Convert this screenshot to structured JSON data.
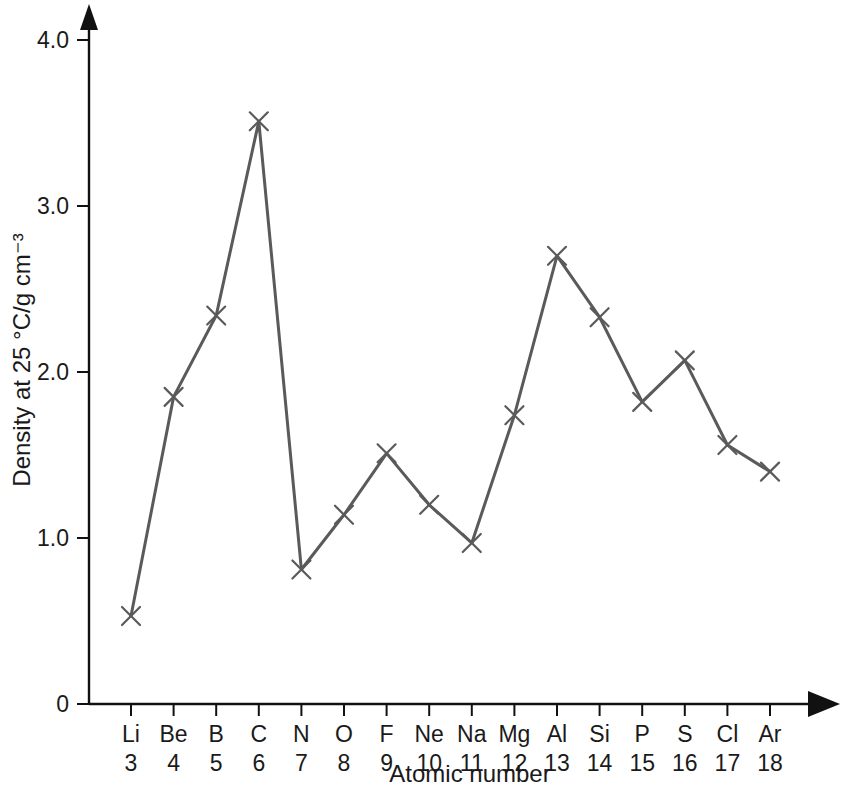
{
  "chart_data": {
    "type": "line",
    "title": "",
    "subtitle": "",
    "xlabel": "Atomic number",
    "ylabel": "Density at 25 °C/g cm⁻³",
    "grid": false,
    "legend": "none",
    "marker": "x-cross",
    "line_color": "#5a5a5a",
    "marker_color": "#5a5a5a",
    "axis_color": "#111111",
    "xlim": [
      0,
      19
    ],
    "ylim": [
      0,
      4.3
    ],
    "yticks": [
      "0",
      "1.0",
      "2.0",
      "3.0",
      "4.0"
    ],
    "ytick_values": [
      0,
      1.0,
      2.0,
      3.0,
      4.0
    ],
    "categories": [
      "Li",
      "Be",
      "B",
      "C",
      "N",
      "O",
      "F",
      "Ne",
      "Na",
      "Mg",
      "Al",
      "Si",
      "P",
      "S",
      "Cl",
      "Ar"
    ],
    "x": [
      3,
      4,
      5,
      6,
      7,
      8,
      9,
      10,
      11,
      12,
      13,
      14,
      15,
      16,
      17,
      18
    ],
    "xtick_numbers": [
      "3",
      "4",
      "5",
      "6",
      "7",
      "8",
      "9",
      "10",
      "11",
      "12",
      "13",
      "14",
      "15",
      "16",
      "17",
      "18"
    ],
    "values": [
      0.53,
      1.85,
      2.34,
      3.51,
      0.81,
      1.14,
      1.51,
      1.2,
      0.97,
      1.74,
      2.7,
      2.33,
      1.82,
      2.07,
      1.56,
      1.4
    ],
    "points": [
      {
        "element": "Li",
        "atomic_number": 3,
        "density": 0.53
      },
      {
        "element": "Be",
        "atomic_number": 4,
        "density": 1.85
      },
      {
        "element": "B",
        "atomic_number": 5,
        "density": 2.34
      },
      {
        "element": "C",
        "atomic_number": 6,
        "density": 3.51
      },
      {
        "element": "N",
        "atomic_number": 7,
        "density": 0.81
      },
      {
        "element": "O",
        "atomic_number": 8,
        "density": 1.14
      },
      {
        "element": "F",
        "atomic_number": 9,
        "density": 1.51
      },
      {
        "element": "Ne",
        "atomic_number": 10,
        "density": 1.2
      },
      {
        "element": "Na",
        "atomic_number": 11,
        "density": 0.97
      },
      {
        "element": "Mg",
        "atomic_number": 12,
        "density": 1.74
      },
      {
        "element": "Al",
        "atomic_number": 13,
        "density": 2.7
      },
      {
        "element": "Si",
        "atomic_number": 14,
        "density": 2.33
      },
      {
        "element": "P",
        "atomic_number": 15,
        "density": 1.82
      },
      {
        "element": "S",
        "atomic_number": 16,
        "density": 2.07
      },
      {
        "element": "Cl",
        "atomic_number": 17,
        "density": 1.56
      },
      {
        "element": "Ar",
        "atomic_number": 18,
        "density": 1.4
      }
    ]
  }
}
